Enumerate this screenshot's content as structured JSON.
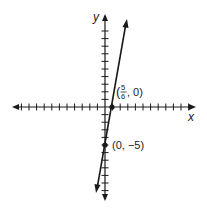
{
  "chart_data": {
    "type": "line",
    "title": "",
    "xlabel": "x",
    "ylabel": "y",
    "grid": false,
    "xlim": [
      -12,
      11
    ],
    "ylim": [
      -11,
      11
    ],
    "tick_spacing": 1,
    "tick_labels_shown": false,
    "series": [
      {
        "name": "y = 6x - 5",
        "slope": 6,
        "intercept": -5,
        "arrows": "both",
        "x": [
          -0.9,
          2.8
        ],
        "y": [
          -10.4,
          11.8
        ]
      }
    ],
    "points": [
      {
        "x": 0.8333,
        "y": 0,
        "label_parts": {
          "open": "(",
          "num": "5",
          "den": "6",
          "rest": ", 0)"
        }
      },
      {
        "x": 0,
        "y": -5,
        "label": "(0, −5)"
      }
    ],
    "color": "#1a1a1a"
  },
  "labels": {
    "x_axis": "x",
    "y_axis": "y",
    "point1_open": "(",
    "point1_num": "5",
    "point1_den": "6",
    "point1_rest": ", 0)",
    "point2": "(0, −5)"
  }
}
